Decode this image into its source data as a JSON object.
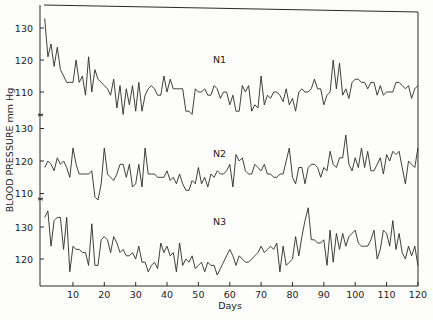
{
  "chart_data": {
    "type": "line",
    "title": "",
    "xlabel": "Days",
    "ylabel": "BLOOD PRESSURE  mm Hg",
    "xlim": [
      0,
      120
    ],
    "x_ticks": [
      10,
      20,
      30,
      40,
      50,
      60,
      70,
      80,
      90,
      100,
      110,
      120
    ],
    "grid": false,
    "legend": "inline-labels",
    "panels": [
      {
        "name": "N1",
        "y_ticks": [
          130,
          120,
          110
        ],
        "ylim": [
          103,
          134
        ],
        "values": [
          133,
          121,
          125,
          118,
          124,
          117,
          115,
          113,
          113,
          113,
          120,
          113,
          115,
          109,
          121,
          110,
          117,
          114,
          113,
          112,
          111,
          109,
          114,
          105,
          112,
          103,
          111,
          106,
          112,
          104,
          113,
          104,
          109,
          111,
          112,
          111,
          109,
          109,
          115,
          110,
          114,
          111,
          111,
          111,
          111,
          104,
          104,
          103,
          111,
          110,
          110,
          111,
          109,
          109,
          112,
          111,
          108,
          110,
          110,
          106,
          109,
          104,
          104,
          112,
          110,
          112,
          104,
          106,
          105,
          115,
          106,
          109,
          108,
          110,
          110,
          109,
          107,
          111,
          106,
          108,
          104,
          110,
          111,
          110,
          110,
          111,
          114,
          111,
          111,
          106,
          109,
          110,
          120,
          111,
          119,
          109,
          111,
          108,
          113,
          114,
          114,
          113,
          113,
          111,
          113,
          113,
          109,
          112,
          109,
          110,
          110,
          110,
          113,
          113,
          112,
          111,
          112,
          108,
          111,
          112
        ]
      },
      {
        "name": "N2",
        "y_ticks": [
          130,
          120,
          110
        ],
        "ylim": [
          107,
          131
        ],
        "values": [
          118,
          120,
          119,
          117,
          121,
          119,
          120,
          118,
          115,
          124,
          119,
          116,
          116,
          116,
          116,
          117,
          109,
          108,
          113,
          124,
          116,
          115,
          114,
          116,
          119,
          119,
          115,
          119,
          112,
          113,
          119,
          112,
          124,
          116,
          116,
          116,
          115,
          115,
          115,
          117,
          114,
          115,
          113,
          116,
          113,
          111,
          111,
          114,
          113,
          118,
          113,
          115,
          112,
          116,
          115,
          117,
          116,
          116,
          117,
          119,
          112,
          122,
          120,
          121,
          117,
          116,
          116,
          119,
          118,
          117,
          119,
          116,
          116,
          115,
          115,
          116,
          116,
          120,
          124,
          115,
          113,
          118,
          118,
          113,
          118,
          119,
          119,
          118,
          115,
          118,
          117,
          123,
          119,
          118,
          121,
          121,
          128,
          119,
          117,
          121,
          118,
          124,
          118,
          123,
          117,
          117,
          119,
          121,
          116,
          122,
          120,
          123,
          122,
          123,
          118,
          113,
          120,
          119,
          118,
          124
        ]
      },
      {
        "name": "N3",
        "y_ticks": [
          130,
          120
        ],
        "ylim": [
          113,
          138
        ],
        "values": [
          133,
          135,
          124,
          132,
          133,
          133,
          123,
          133,
          116,
          124,
          123,
          123,
          122,
          122,
          118,
          131,
          118,
          118,
          126,
          127,
          126,
          122,
          127,
          125,
          122,
          123,
          121,
          121,
          122,
          120,
          124,
          119,
          119,
          116,
          118,
          119,
          117,
          125,
          122,
          124,
          121,
          122,
          116,
          125,
          118,
          120,
          119,
          121,
          117,
          118,
          119,
          116,
          119,
          118,
          118,
          115,
          117,
          119,
          121,
          123,
          121,
          118,
          121,
          120,
          119,
          119,
          120,
          121,
          122,
          124,
          122,
          123,
          124,
          123,
          125,
          116,
          124,
          118,
          119,
          120,
          127,
          121,
          127,
          132,
          136,
          126,
          126,
          125,
          125,
          126,
          118,
          129,
          119,
          128,
          123,
          128,
          124,
          127,
          128,
          129,
          125,
          124,
          124,
          124,
          126,
          129,
          120,
          123,
          129,
          128,
          124,
          132,
          123,
          128,
          122,
          120,
          124,
          121,
          124,
          118
        ]
      }
    ]
  }
}
